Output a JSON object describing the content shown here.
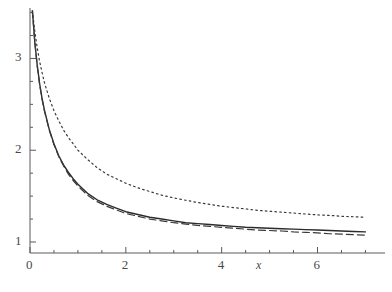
{
  "figure": {
    "background_color": "#ffffff",
    "axis_color": "#5a5a5a",
    "text_color": "#4a4a4a"
  },
  "chart_data": {
    "type": "line",
    "title": "",
    "subtitle": "",
    "xlabel": "x",
    "ylabel": "",
    "xlim": [
      0,
      7.2
    ],
    "ylim": [
      0.88,
      3.55
    ],
    "grid": false,
    "legend": null,
    "legend_position": "none",
    "x_ticks_major": [
      0,
      2,
      4,
      6
    ],
    "x_tick_labels": [
      "0",
      "2",
      "4",
      "6"
    ],
    "x_ticks_minor": [
      0.5,
      1,
      1.5,
      2.5,
      3,
      3.5,
      4.5,
      5,
      5.5,
      6.5,
      7
    ],
    "y_ticks_major": [
      1,
      2,
      3
    ],
    "y_tick_labels": [
      "1",
      "2",
      "3"
    ],
    "y_ticks_minor": [
      1.25,
      1.5,
      1.75,
      2.25,
      2.5,
      2.75,
      3.25,
      3.5
    ],
    "x": [
      0.05,
      0.1,
      0.15,
      0.2,
      0.25,
      0.3,
      0.4,
      0.5,
      0.6,
      0.7,
      0.8,
      0.9,
      1.0,
      1.2,
      1.4,
      1.6,
      1.8,
      2.0,
      2.25,
      2.5,
      2.75,
      3.0,
      3.25,
      3.5,
      3.75,
      4.0,
      4.25,
      4.5,
      4.75,
      5.0,
      5.25,
      5.5,
      5.75,
      6.0,
      6.25,
      6.5,
      6.75,
      7.0
    ],
    "series": [
      {
        "name": "solid-curve",
        "style": "solid",
        "color": "#2b2b2b",
        "values": [
          3.52,
          3.18,
          2.93,
          2.73,
          2.57,
          2.44,
          2.23,
          2.07,
          1.94,
          1.84,
          1.76,
          1.69,
          1.63,
          1.53,
          1.46,
          1.41,
          1.37,
          1.33,
          1.3,
          1.27,
          1.25,
          1.23,
          1.21,
          1.2,
          1.19,
          1.18,
          1.17,
          1.16,
          1.155,
          1.15,
          1.145,
          1.14,
          1.135,
          1.13,
          1.125,
          1.12,
          1.115,
          1.11
        ]
      },
      {
        "name": "dashed-curve",
        "style": "dashed",
        "color": "#3a3a3a",
        "values": [
          3.52,
          3.18,
          2.92,
          2.72,
          2.56,
          2.43,
          2.22,
          2.06,
          1.93,
          1.83,
          1.74,
          1.67,
          1.61,
          1.51,
          1.44,
          1.39,
          1.35,
          1.31,
          1.28,
          1.25,
          1.23,
          1.21,
          1.195,
          1.18,
          1.17,
          1.16,
          1.15,
          1.14,
          1.13,
          1.125,
          1.12,
          1.11,
          1.105,
          1.1,
          1.09,
          1.085,
          1.08,
          1.075
        ]
      },
      {
        "name": "dotted-curve",
        "style": "dotted",
        "color": "#3a3a3a",
        "values": [
          3.52,
          3.3,
          3.12,
          2.97,
          2.85,
          2.74,
          2.57,
          2.43,
          2.32,
          2.22,
          2.14,
          2.07,
          2.0,
          1.9,
          1.81,
          1.74,
          1.69,
          1.64,
          1.59,
          1.55,
          1.51,
          1.48,
          1.455,
          1.43,
          1.41,
          1.39,
          1.375,
          1.36,
          1.345,
          1.335,
          1.325,
          1.315,
          1.305,
          1.295,
          1.29,
          1.28,
          1.275,
          1.27
        ]
      }
    ]
  },
  "axes": {
    "x_axis_name": "x",
    "y_axis_name": ""
  }
}
